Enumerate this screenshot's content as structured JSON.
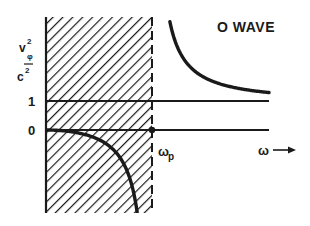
{
  "chart_data": {
    "type": "line",
    "title": "O WAVE",
    "xlabel": "ω",
    "xlabel_arrow": "→",
    "ylabel": {
      "numerator": "v",
      "numerator_superscript": "2",
      "numerator_subscript": "φ",
      "denominator": "c",
      "denominator_superscript": "2"
    },
    "y_ticks": [
      {
        "value": 1,
        "label": "1"
      },
      {
        "value": 0,
        "label": "0"
      }
    ],
    "x_markers": [
      {
        "value": 1,
        "label": "ω",
        "label_subscript": "p",
        "style": "dashed-vertical"
      }
    ],
    "shaded_region": {
      "x_from": 0,
      "x_to": 1,
      "pattern": "diagonal-hatch",
      "meaning": "evanescent (ω < ωp)"
    },
    "reference_lines": [
      {
        "y": 1,
        "label": "1"
      },
      {
        "y": 0,
        "label": "0"
      }
    ],
    "formula": "v_phi^2 / c^2 = 1 / (1 - (omega_p/omega)^2)",
    "series": [
      {
        "name": "below-cutoff",
        "x_range": [
          0,
          1
        ],
        "behavior": "starts at 0, decreases to -infinity as ω → ωp"
      },
      {
        "name": "above-cutoff",
        "x_range": [
          1,
          3.6
        ],
        "behavior": "decreases from +infinity at ωp, approaches 1 asymptotically"
      }
    ],
    "xlim": [
      0,
      3.6
    ],
    "grid": false,
    "legend": "none"
  }
}
